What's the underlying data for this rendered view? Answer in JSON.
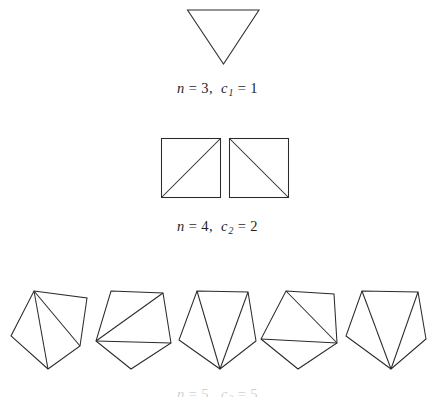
{
  "figure": {
    "title_visible": false,
    "background_color": "#ffffff",
    "stroke_color": "#2b2b2b"
  },
  "rows": [
    {
      "id": "triangle-row",
      "n_label": "n",
      "n_value": "3",
      "c_symbol": "c",
      "c_index": "1",
      "c_value": "1",
      "caption": "n = 3,  c1 = 1",
      "shape": "triangle",
      "count": 1,
      "description": "downward-pointing triangle, single triangulation"
    },
    {
      "id": "square-row",
      "n_label": "n",
      "n_value": "4",
      "c_symbol": "c",
      "c_index": "2",
      "c_value": "2",
      "caption": "n = 4,  c2 = 2",
      "shape": "square",
      "count": 2,
      "description": "two squares, diagonals drawn in each of the two possible ways"
    },
    {
      "id": "pentagon-row",
      "n_label": "n",
      "n_value": "5",
      "c_symbol": "c",
      "c_index": "3",
      "c_value": "5",
      "caption": "n = 5,  c3 = 5",
      "shape": "pentagon",
      "count": 5,
      "description": "five pentagons, each showing one of the five triangulations"
    }
  ],
  "equals": "=",
  "comma": ","
}
